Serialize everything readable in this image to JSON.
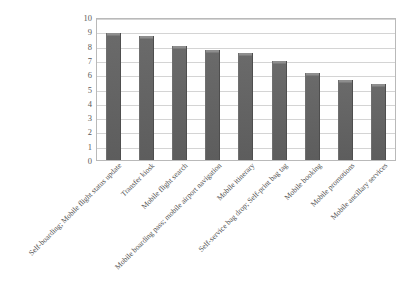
{
  "chart_data": {
    "type": "bar",
    "title": "",
    "xlabel": "",
    "ylabel": "",
    "ylim": [
      0,
      10
    ],
    "ytick_step": 1,
    "grid": true,
    "legend": "none",
    "bar_color": "#5d5d5d",
    "plot_border_color": "#b9b9b9",
    "gridline_color": "#d4d4d4",
    "ytick_labels": [
      "10",
      "9",
      "8",
      "7",
      "6",
      "5",
      "4",
      "3",
      "2",
      "1",
      "0"
    ],
    "categories": [
      "Self-boarding; Mobile flight status update",
      "Transfer kiosk",
      "Mobile flight search",
      "Mobile boarding pass; mobile airport navigation",
      "Mobile itinerary",
      "Self-service bag drop; Self-print bag tag",
      "Mobile booking",
      "Mobile promotions",
      "Mobile ancillary services"
    ],
    "values": [
      8.9,
      8.7,
      8.0,
      7.7,
      7.5,
      6.9,
      6.1,
      5.6,
      5.3
    ]
  }
}
